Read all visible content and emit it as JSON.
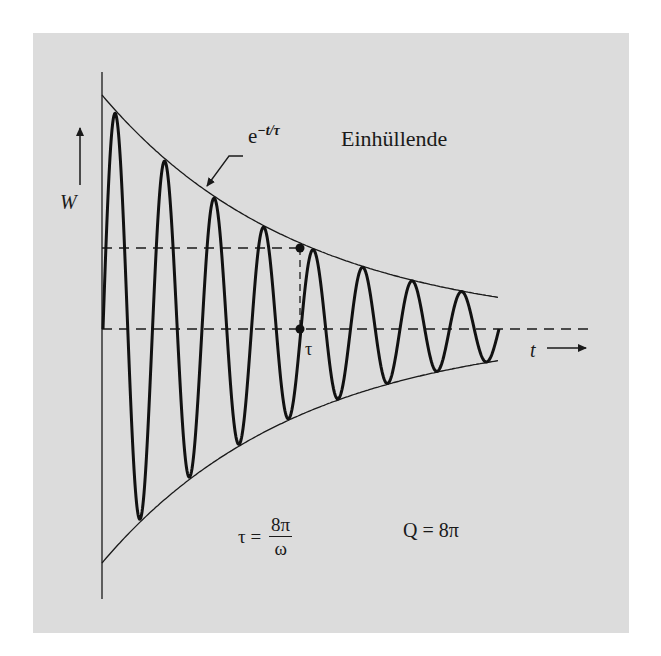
{
  "figure": {
    "background_color": "#dcdcdc",
    "line_color": "#1a1a1a",
    "envelope_label": {
      "base": "e",
      "exponent": "−t/τ",
      "word": "Einhüllende"
    },
    "y_axis_label": "W",
    "x_axis_label": "t",
    "tau_marker_label": "τ",
    "tau_equation": {
      "lhs": "τ =",
      "numerator": "8π",
      "denominator": "ω"
    },
    "q_equation": "Q = 8π"
  },
  "chart_data": {
    "type": "line",
    "title": "",
    "xlabel": "t",
    "ylabel": "W",
    "series": [
      {
        "name": "W(t) oscillation",
        "style": "thick solid",
        "model": "e^(-t/tau) * cos(omega t)",
        "cycles_shown": 8
      },
      {
        "name": "upper envelope e^(-t/τ)",
        "style": "thin solid"
      },
      {
        "name": "lower envelope -e^(-t/τ)",
        "style": "thin solid"
      }
    ],
    "annotations": [
      {
        "text": "e^(−t/τ) Einhüllende",
        "target": "upper envelope",
        "arrow": true
      },
      {
        "text": "τ",
        "position": "x = τ on time axis, marked with dot"
      },
      {
        "text": "dashed horizontal line at envelope level 1/e"
      },
      {
        "text": "dashed zero line (time axis)"
      },
      {
        "text": "τ = 8π/ω"
      },
      {
        "text": "Q = 8π"
      }
    ],
    "parameters": {
      "tau": "8π/ω",
      "Q": "8π"
    },
    "normalized_x_range": [
      0,
      1.45
    ],
    "normalized_y_range": [
      -1,
      1
    ],
    "tau_x_normalized": 1.0,
    "envelope_at_tau": 0.368,
    "grid": false,
    "legend": "none"
  }
}
